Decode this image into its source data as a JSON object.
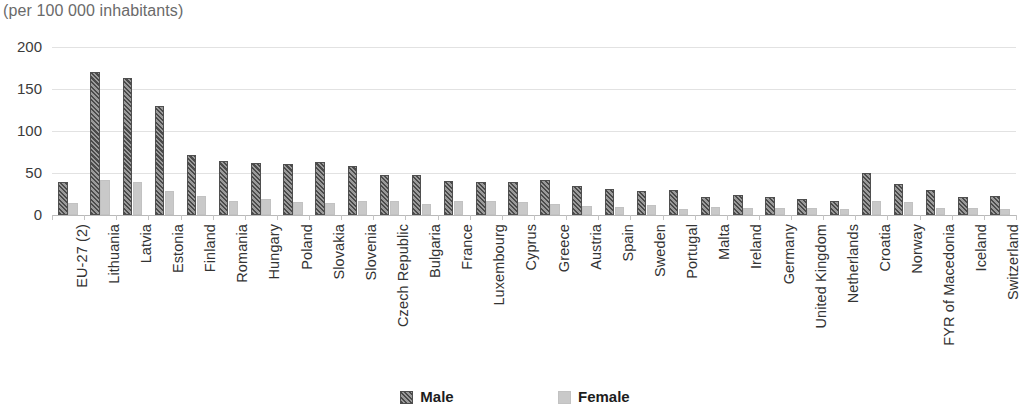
{
  "subtitle": "(per 100 000 inhabitants)",
  "legend": {
    "male_label": "Male",
    "female_label": "Female"
  },
  "colors": {
    "male": "#4a4a4a",
    "female": "#c9c9c9",
    "gridline": "#e2e2e2",
    "text": "#3b3b3b",
    "subtitle": "#6a6a6a"
  },
  "chart_data": {
    "type": "bar",
    "title": "",
    "subtitle": "(per 100 000 inhabitants)",
    "xlabel": "",
    "ylabel": "",
    "ylim": [
      0,
      200
    ],
    "yticks": [
      0,
      50,
      100,
      150,
      200
    ],
    "grid": true,
    "legend_position": "bottom",
    "categories": [
      "EU-27 (2)",
      "Lithuania",
      "Latvia",
      "Estonia",
      "Finland",
      "Romania",
      "Hungary",
      "Poland",
      "Slovakia",
      "Slovenia",
      "Czech Republic",
      "Bulgaria",
      "France",
      "Luxembourg",
      "Cyprus",
      "Greece",
      "Austria",
      "Spain",
      "Sweden",
      "Portugal",
      "Malta",
      "Ireland",
      "Germany",
      "United Kingdom",
      "Netherlands",
      "Croatia",
      "Norway",
      "FYR of Macedonia",
      "Iceland",
      "Switzerland"
    ],
    "series": [
      {
        "name": "Male",
        "values": [
          39,
          170,
          163,
          130,
          71,
          64,
          62,
          61,
          63,
          58,
          48,
          48,
          41,
          39,
          39,
          42,
          34,
          31,
          28,
          30,
          21,
          24,
          21,
          19,
          17,
          50,
          37,
          30,
          21,
          23
        ]
      },
      {
        "name": "Female",
        "values": [
          14,
          42,
          39,
          29,
          23,
          17,
          19,
          16,
          14,
          17,
          17,
          13,
          17,
          17,
          15,
          13,
          11,
          10,
          12,
          7,
          9,
          8,
          8,
          8,
          7,
          17,
          15,
          8,
          8,
          7
        ]
      }
    ]
  }
}
